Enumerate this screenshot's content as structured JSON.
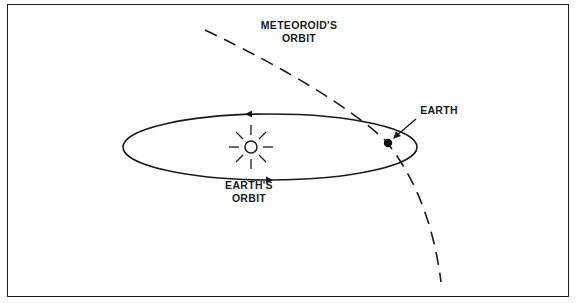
{
  "diagram": {
    "labels": {
      "meteoroid_orbit_line1": "METEOROID'S",
      "meteoroid_orbit_line2": "ORBIT",
      "earth": "EARTH",
      "earths_orbit_line1": "EARTH'S",
      "earths_orbit_line2": "ORBIT"
    },
    "elements": {
      "sun": "sun-icon",
      "earth": "earth-dot",
      "earth_orbit": "ellipse-solid",
      "meteoroid_orbit": "dashed-curve",
      "earth_pointer": "arrow"
    },
    "colors": {
      "line": "#1a1a1a",
      "background": "#ffffff"
    }
  }
}
